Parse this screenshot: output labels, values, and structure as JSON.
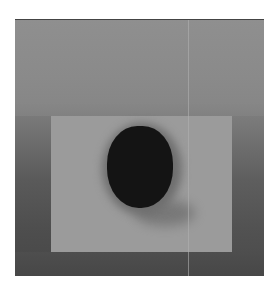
{
  "image": {
    "description": "Low-resolution grayscale pixelated image with a dark circular blob centered over a lighter rectangular region, surrounded by darker gray borders",
    "colors": {
      "top_region": "#8e8e8e",
      "inner_rect": "#9b9b9b",
      "dark_sides": "#4e4e4e",
      "blob": "#141414",
      "frame_top_line": "#444444"
    }
  }
}
